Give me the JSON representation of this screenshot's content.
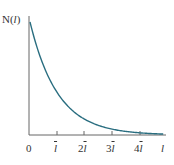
{
  "chart_data": {
    "type": "line",
    "title": "",
    "ylabel": "N(l)",
    "xlabel": "l",
    "x_ticks": [
      "0",
      "l̄",
      "2l̄",
      "3l̄",
      "4l̄"
    ],
    "x_tick_units": [
      0,
      1,
      2,
      3,
      4
    ],
    "xlim": [
      0,
      4.8
    ],
    "ylim": [
      0,
      1.0
    ],
    "grid": false,
    "legend": null,
    "series": [
      {
        "name": "N(l) = N0 exp(-l / l̄)",
        "color": "#2a6e80",
        "x": [
          0,
          0.5,
          1,
          1.5,
          2,
          2.5,
          3,
          3.5,
          4,
          4.5,
          4.8
        ],
        "values": [
          1.0,
          0.607,
          0.368,
          0.223,
          0.135,
          0.082,
          0.05,
          0.03,
          0.018,
          0.011,
          0.008
        ]
      }
    ]
  },
  "labels": {
    "y_axis_N": "N(",
    "y_axis_l": "l",
    "y_axis_close": ")",
    "zero": "0",
    "tick1_coef": "",
    "tick2_coef": "2",
    "tick3_coef": "3",
    "tick4_coef": "4",
    "tick_l": "l",
    "x_axis": "l"
  },
  "colors": {
    "curve": "#2a6e80",
    "axis": "#555555"
  }
}
